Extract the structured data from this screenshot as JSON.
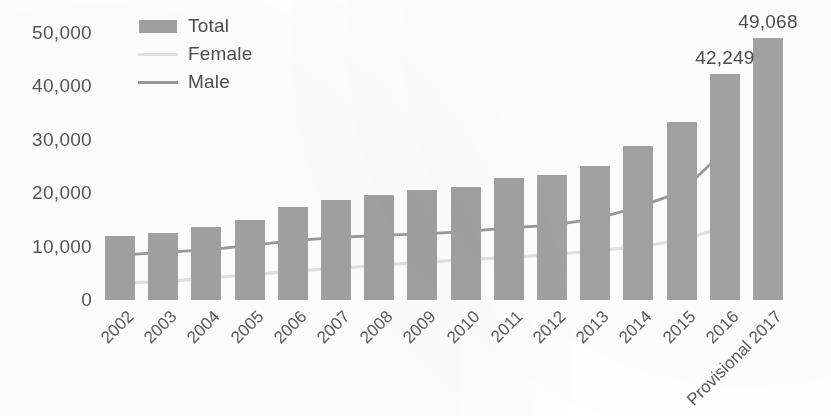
{
  "legend": {
    "position": "top-left-inside",
    "items": [
      {
        "label": "Total",
        "kind": "bar",
        "color": "#a3a2a2",
        "icon": "bar-swatch-icon"
      },
      {
        "label": "Female",
        "kind": "line",
        "color": "#e3e3e3",
        "icon": "line-swatch-icon"
      },
      {
        "label": "Male",
        "kind": "line",
        "color": "#9b9999",
        "icon": "line-swatch-icon"
      }
    ]
  },
  "axis": {
    "y_ticks": [
      "0",
      "10,000",
      "20,000",
      "30,000",
      "40,000",
      "50,000"
    ],
    "x_ticks": [
      "2002",
      "2003",
      "2004",
      "2005",
      "2006",
      "2007",
      "2008",
      "2009",
      "2010",
      "2011",
      "2012",
      "2013",
      "2014",
      "2015",
      "2016",
      "Provisional 2017"
    ]
  },
  "chart_data": {
    "type": "bar",
    "title": "",
    "subtitle": "",
    "xlabel": "",
    "ylabel": "",
    "ylim": [
      0,
      50000
    ],
    "y_ticks": [
      0,
      10000,
      20000,
      30000,
      40000,
      50000
    ],
    "grid": false,
    "legend_position": "top-left-inside",
    "categories": [
      "2002",
      "2003",
      "2004",
      "2005",
      "2006",
      "2007",
      "2008",
      "2009",
      "2010",
      "2011",
      "2012",
      "2013",
      "2014",
      "2015",
      "2016",
      "Provisional 2017"
    ],
    "series": [
      {
        "name": "Total",
        "type": "bar",
        "color": "#a3a2a2",
        "values": [
          11900,
          12600,
          13700,
          14900,
          17500,
          18700,
          19600,
          20600,
          21100,
          22800,
          23500,
          25100,
          28900,
          33400,
          42249,
          49068
        ]
      },
      {
        "name": "Male",
        "type": "line",
        "color": "#9b9999",
        "values": [
          8400,
          8900,
          9400,
          10200,
          11100,
          11700,
          12100,
          12400,
          12800,
          13500,
          14000,
          15200,
          17400,
          20300,
          28000,
          null
        ]
      },
      {
        "name": "Female",
        "type": "line",
        "color": "#e3e3e3",
        "values": [
          3200,
          3400,
          4100,
          4700,
          5400,
          5900,
          6500,
          7100,
          7500,
          8000,
          8500,
          9200,
          10000,
          11200,
          13700,
          null
        ]
      }
    ],
    "data_labels": [
      {
        "category": "2016",
        "value": 42249,
        "text": "42,249"
      },
      {
        "category": "Provisional 2017",
        "value": 49068,
        "text": "49,068"
      }
    ]
  }
}
